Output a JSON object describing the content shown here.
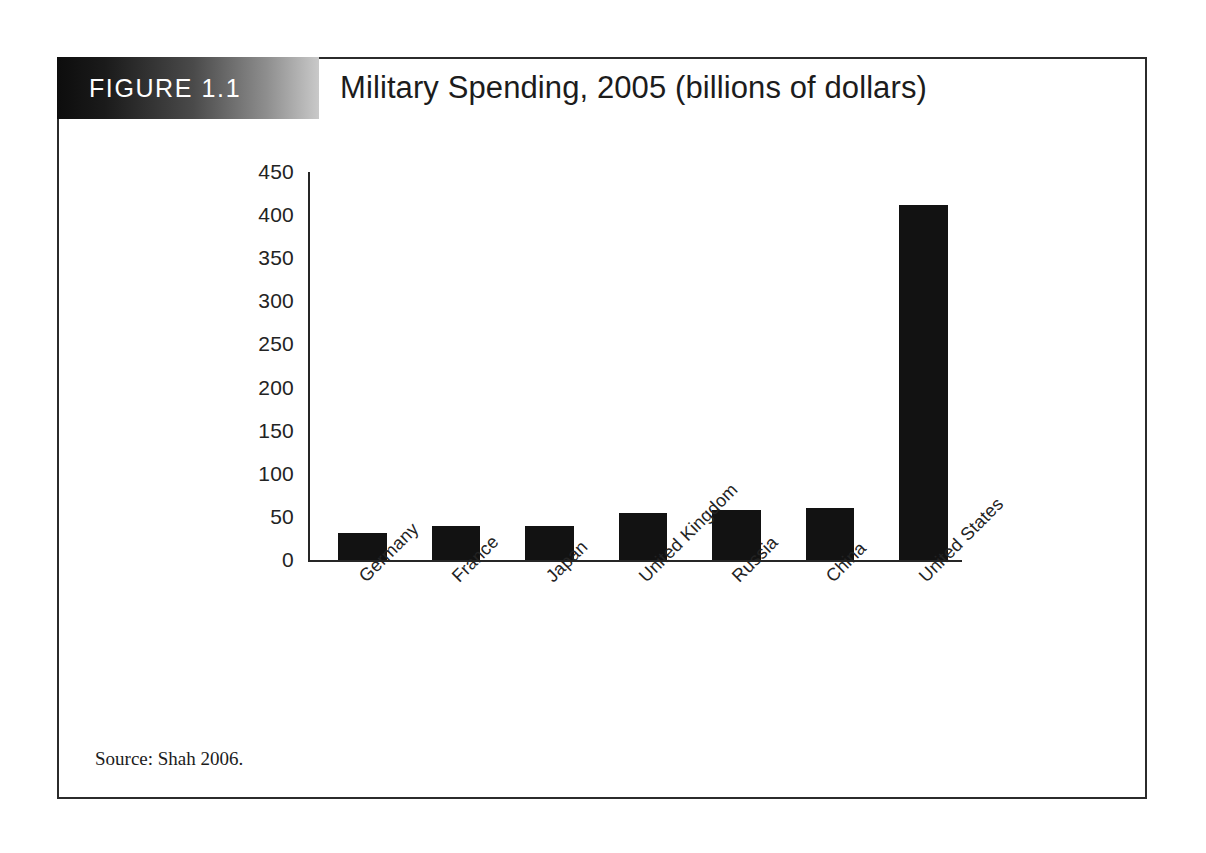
{
  "figure": {
    "label": "FIGURE 1.1",
    "source_note": "Source: Shah 2006."
  },
  "chart_data": {
    "type": "bar",
    "title": "Military Spending, 2005 (billions of dollars)",
    "xlabel": "",
    "ylabel": "",
    "ylim": [
      0,
      450
    ],
    "ytick_values": [
      450,
      400,
      350,
      300,
      250,
      200,
      150,
      100,
      50,
      0
    ],
    "ytick_labels": [
      "450",
      "400",
      "350",
      "300",
      "250",
      "200",
      "150",
      "100",
      "50",
      "0"
    ],
    "grid": false,
    "legend": "none",
    "bar_color": "#121212",
    "categories": [
      "Germany",
      "France",
      "Japan",
      "United Kingdom",
      "Russia",
      "China",
      "United States"
    ],
    "values": [
      31,
      39,
      40,
      55,
      58,
      60,
      412
    ]
  }
}
